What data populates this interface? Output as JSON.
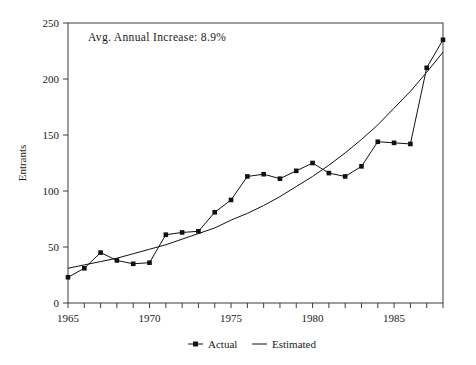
{
  "chart_data": {
    "type": "line",
    "title": "",
    "subtitle": "",
    "xlabel": "",
    "ylabel": "Entrants",
    "xlim": [
      1965,
      1988
    ],
    "ylim": [
      0,
      250
    ],
    "grid": false,
    "legend_position": "bottom-center",
    "annotations": [
      {
        "text": "Avg. Annual Increase: 8.9%",
        "x": 1966.2,
        "y": 237
      }
    ],
    "x": [
      1965,
      1966,
      1967,
      1968,
      1969,
      1970,
      1971,
      1972,
      1973,
      1974,
      1975,
      1976,
      1977,
      1978,
      1979,
      1980,
      1981,
      1982,
      1983,
      1984,
      1985,
      1986,
      1987,
      1988
    ],
    "xticks": [
      1965,
      1966,
      1967,
      1968,
      1969,
      1970,
      1971,
      1972,
      1973,
      1974,
      1975,
      1976,
      1977,
      1978,
      1979,
      1980,
      1981,
      1982,
      1983,
      1984,
      1985,
      1986,
      1987,
      1988
    ],
    "xtick_labels": [
      "1965",
      "",
      "",
      "",
      "",
      "1970",
      "",
      "",
      "",
      "",
      "1975",
      "",
      "",
      "",
      "",
      "1980",
      "",
      "",
      "",
      "",
      "1985",
      "",
      "",
      ""
    ],
    "xtick_labels_shown": [
      "1965",
      "1970",
      "1975",
      "1980",
      "1985"
    ],
    "yticks": [
      0,
      50,
      100,
      150,
      200,
      250
    ],
    "ytick_labels": [
      "0",
      "50",
      "100",
      "150",
      "200",
      "250"
    ],
    "series": [
      {
        "name": "Actual",
        "marker": "square",
        "color": "#111111",
        "values": [
          23,
          31,
          45,
          38,
          35,
          36,
          61,
          63,
          64,
          81,
          92,
          113,
          115,
          111,
          118,
          125,
          116,
          113,
          122,
          144,
          143,
          142,
          210,
          235
        ]
      },
      {
        "name": "Estimated",
        "marker": "none",
        "color": "#111111",
        "values": [
          31,
          34,
          37,
          40,
          44,
          48,
          52,
          57,
          62,
          67,
          74,
          80,
          87,
          95,
          104,
          113,
          123,
          134,
          146,
          159,
          174,
          189,
          206,
          224
        ]
      }
    ]
  },
  "legend": {
    "items": [
      {
        "label": "Actual",
        "glyph": "square-marker-with-line"
      },
      {
        "label": "Estimated",
        "glyph": "plain-line"
      }
    ]
  },
  "axis": {
    "y_title": "Entrants"
  }
}
